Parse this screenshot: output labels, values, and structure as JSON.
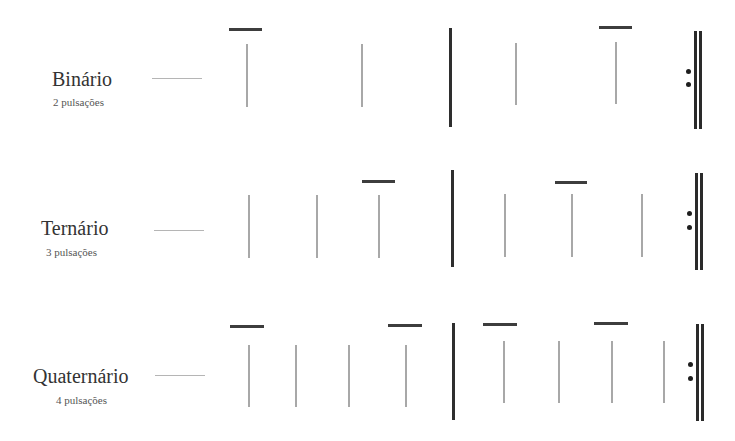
{
  "rows": [
    {
      "id": "binario",
      "title": "Binário",
      "subtitle": "2 pulsações",
      "beats_per_measure": 2,
      "layout": {
        "title": {
          "x": 52,
          "y": 68
        },
        "subtitle": {
          "x": 53,
          "y": 96
        },
        "connector": {
          "x": 152,
          "y": 78,
          "w": 50
        },
        "beats": [
          {
            "x": 246,
            "y": 44,
            "h": 63
          },
          {
            "x": 361,
            "y": 44,
            "h": 63
          },
          {
            "x": 515,
            "y": 43,
            "h": 62
          },
          {
            "x": 615,
            "y": 42,
            "h": 62
          }
        ],
        "accents": [
          {
            "x": 229,
            "y": 28,
            "w": 33
          },
          {
            "x": 599,
            "y": 26,
            "w": 33
          }
        ],
        "barline": {
          "x": 449,
          "y": 28,
          "h": 99
        },
        "repeat": {
          "dot1": {
            "x": 686,
            "y": 69
          },
          "dot2": {
            "x": 686,
            "y": 82
          },
          "bar1x": 694,
          "bar2x": 699,
          "y": 31,
          "h": 98
        }
      }
    },
    {
      "id": "ternario",
      "title": "Ternário",
      "subtitle": "3 pulsações",
      "beats_per_measure": 3,
      "layout": {
        "title": {
          "x": 41,
          "y": 217
        },
        "subtitle": {
          "x": 46,
          "y": 246
        },
        "connector": {
          "x": 154,
          "y": 230,
          "w": 50
        },
        "beats": [
          {
            "x": 248,
            "y": 195,
            "h": 63
          },
          {
            "x": 316,
            "y": 195,
            "h": 63
          },
          {
            "x": 378,
            "y": 195,
            "h": 63
          },
          {
            "x": 504,
            "y": 194,
            "h": 63
          },
          {
            "x": 571,
            "y": 194,
            "h": 63
          },
          {
            "x": 641,
            "y": 194,
            "h": 63
          }
        ],
        "accents": [
          {
            "x": 362,
            "y": 180,
            "w": 33
          },
          {
            "x": 555,
            "y": 181,
            "w": 32
          }
        ],
        "barline": {
          "x": 451,
          "y": 170,
          "h": 97
        },
        "repeat": {
          "dot1": {
            "x": 687,
            "y": 211
          },
          "dot2": {
            "x": 687,
            "y": 225
          },
          "bar1x": 695,
          "bar2x": 700,
          "y": 173,
          "h": 97
        }
      }
    },
    {
      "id": "quaternario",
      "title": "Quaternário",
      "subtitle": "4 pulsações",
      "beats_per_measure": 4,
      "layout": {
        "title": {
          "x": 33,
          "y": 365
        },
        "subtitle": {
          "x": 56,
          "y": 394
        },
        "connector": {
          "x": 155,
          "y": 375,
          "w": 50
        },
        "beats": [
          {
            "x": 248,
            "y": 345,
            "h": 62
          },
          {
            "x": 295,
            "y": 345,
            "h": 62
          },
          {
            "x": 348,
            "y": 345,
            "h": 62
          },
          {
            "x": 405,
            "y": 345,
            "h": 62
          },
          {
            "x": 503,
            "y": 341,
            "h": 62
          },
          {
            "x": 558,
            "y": 341,
            "h": 62
          },
          {
            "x": 611,
            "y": 341,
            "h": 62
          },
          {
            "x": 663,
            "y": 341,
            "h": 62
          }
        ],
        "accents": [
          {
            "x": 230,
            "y": 325,
            "w": 34
          },
          {
            "x": 388,
            "y": 324,
            "w": 34
          },
          {
            "x": 483,
            "y": 323,
            "w": 34
          },
          {
            "x": 594,
            "y": 322,
            "w": 34
          }
        ],
        "barline": {
          "x": 452,
          "y": 323,
          "h": 97
        },
        "repeat": {
          "dot1": {
            "x": 688,
            "y": 362
          },
          "dot2": {
            "x": 688,
            "y": 376
          },
          "bar1x": 696,
          "bar2x": 701,
          "y": 324,
          "h": 97
        }
      }
    }
  ]
}
